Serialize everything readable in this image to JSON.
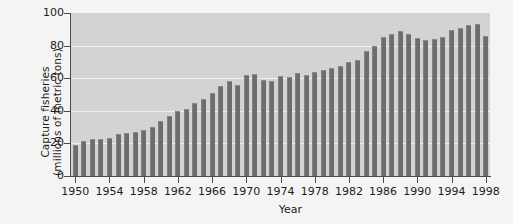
{
  "chart_data": {
    "type": "bar",
    "title": "",
    "subtitle": "",
    "xlabel": "Year",
    "ylabel": "Capture fisheries (millions of metric tons)",
    "ylabel_line1": "Capture fisheries",
    "ylabel_line2": "(millions of metric tons)",
    "ylim": [
      0,
      100
    ],
    "xlim": [
      1950,
      1998
    ],
    "yticks": [
      0,
      20,
      40,
      60,
      80,
      100
    ],
    "ytick_labels": [
      "0",
      "20",
      "40",
      "60",
      "80",
      "100"
    ],
    "xticks": [
      1950,
      1954,
      1958,
      1962,
      1966,
      1970,
      1974,
      1978,
      1982,
      1986,
      1990,
      1994,
      1998
    ],
    "xtick_labels": [
      "1950",
      "1954",
      "1958",
      "1962",
      "1966",
      "1970",
      "1974",
      "1978",
      "1982",
      "1986",
      "1990",
      "1994",
      "1998"
    ],
    "grid": true,
    "grid_axis": "y",
    "legend": null,
    "legend_position": "none",
    "bar_color": "#6d6d6d",
    "plot_background": "#d3d3d3",
    "figure_background": "#f4f4f4",
    "gridline_color": "#efefef",
    "axis_color": "#4a4a4a",
    "text_color": "#1c1c1c",
    "categories": [
      1950,
      1951,
      1952,
      1953,
      1954,
      1955,
      1956,
      1957,
      1958,
      1959,
      1960,
      1961,
      1962,
      1963,
      1964,
      1965,
      1966,
      1967,
      1968,
      1969,
      1970,
      1971,
      1972,
      1973,
      1974,
      1975,
      1976,
      1977,
      1978,
      1979,
      1980,
      1981,
      1982,
      1983,
      1984,
      1985,
      1986,
      1987,
      1988,
      1989,
      1990,
      1991,
      1992,
      1993,
      1994,
      1995,
      1996,
      1997,
      1998
    ],
    "values": [
      19,
      21.5,
      22.5,
      23,
      23.5,
      25.5,
      26.5,
      27,
      28,
      30,
      34,
      37,
      40,
      41,
      45,
      47,
      51,
      55,
      58,
      56,
      62,
      62.5,
      59,
      58.5,
      61.5,
      60.5,
      63,
      62,
      64,
      65,
      66,
      67.5,
      70,
      71,
      77,
      80,
      85,
      87,
      89,
      87,
      84.5,
      83.5,
      84,
      85,
      89.5,
      91,
      92.5,
      93,
      86
    ]
  }
}
